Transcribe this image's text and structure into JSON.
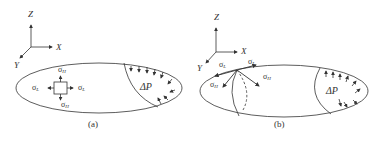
{
  "panels": [
    {
      "id": "a",
      "caption": "(a)",
      "axes": {
        "z": "Z",
        "x": "X",
        "y": "Y"
      },
      "stress_labels": {
        "hoop_top": "σ",
        "hoop_top_sub": "H",
        "hoop_bottom": "σ",
        "hoop_bottom_sub": "H",
        "long_left": "σ",
        "long_left_sub": "L",
        "long_right": "σ",
        "long_right_sub": "L"
      },
      "pressure_label": "ΔP"
    },
    {
      "id": "b",
      "caption": "(b)",
      "axes": {
        "z": "Z",
        "x": "X",
        "y": "Y"
      },
      "stress_labels": {
        "long_left": "σ",
        "long_left_sub": "L",
        "long_right": "σ",
        "long_right_sub": "L",
        "hoop_left": "σ",
        "hoop_left_sub": "H",
        "hoop_right": "σ",
        "hoop_right_sub": "H"
      },
      "pressure_label": "ΔP"
    }
  ],
  "colors": {
    "line": "#333333",
    "background": "#ffffff"
  }
}
